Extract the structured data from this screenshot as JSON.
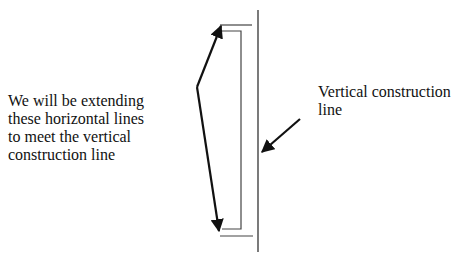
{
  "diagram": {
    "left_annotation": {
      "lines": [
        "We will be extending",
        "these horizontal lines",
        "to meet the vertical",
        "construction line"
      ]
    },
    "right_annotation": {
      "lines": [
        "Vertical construction",
        "line"
      ]
    },
    "colors": {
      "line": "#333333",
      "arrow": "#111111",
      "text": "#111111"
    }
  }
}
